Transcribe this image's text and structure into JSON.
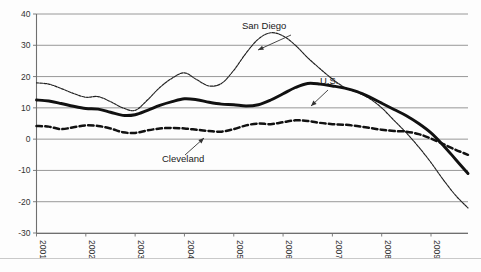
{
  "chart_data": {
    "type": "line",
    "title": "",
    "subtitle": "",
    "xlabel": "",
    "ylabel": "",
    "grid": true,
    "legend_position": "inline-annotations",
    "xlim": [
      2001,
      2009.75
    ],
    "ylim": [
      -30,
      40
    ],
    "yticks": [
      40,
      30,
      20,
      10,
      0,
      -10,
      -20,
      -30
    ],
    "ytick_labels": [
      "40",
      "30",
      "20",
      "10",
      "0",
      "-10",
      "-20",
      "-30"
    ],
    "xticks": [
      2001,
      2002,
      2003,
      2004,
      2005,
      2006,
      2007,
      2008,
      2009
    ],
    "xtick_labels": [
      "2001",
      "2002",
      "2003",
      "2004",
      "2005",
      "2006",
      "2007",
      "2008",
      "2009"
    ],
    "xtick_rotation": 90,
    "x": [
      2001.0,
      2001.25,
      2001.5,
      2001.75,
      2002.0,
      2002.25,
      2002.5,
      2002.75,
      2003.0,
      2003.25,
      2003.5,
      2003.75,
      2004.0,
      2004.25,
      2004.5,
      2004.75,
      2005.0,
      2005.25,
      2005.5,
      2005.75,
      2006.0,
      2006.25,
      2006.5,
      2006.75,
      2007.0,
      2007.25,
      2007.5,
      2007.75,
      2008.0,
      2008.25,
      2008.5,
      2008.75,
      2009.0,
      2009.25,
      2009.5,
      2009.75
    ],
    "series": [
      {
        "name": "San Diego",
        "style": "thin-dotted",
        "values": [
          18.0,
          17.6,
          16.2,
          14.6,
          13.4,
          13.6,
          12.0,
          10.0,
          9.2,
          12.5,
          16.5,
          19.5,
          21.2,
          19.0,
          17.0,
          17.8,
          22.0,
          27.5,
          32.0,
          34.0,
          33.0,
          30.0,
          26.0,
          22.5,
          19.2,
          16.5,
          15.0,
          13.0,
          10.0,
          6.0,
          2.0,
          -2.5,
          -7.5,
          -13.0,
          -18.0,
          -22.0
        ]
      },
      {
        "name": "U.S.",
        "style": "thick-solid",
        "values": [
          12.5,
          12.2,
          11.4,
          10.5,
          9.8,
          9.6,
          8.6,
          7.6,
          7.8,
          9.2,
          10.8,
          12.0,
          12.9,
          12.6,
          11.8,
          11.2,
          11.0,
          10.6,
          11.0,
          12.5,
          14.5,
          16.5,
          17.8,
          17.6,
          17.0,
          16.3,
          15.2,
          13.5,
          11.5,
          9.5,
          7.5,
          5.0,
          2.0,
          -2.0,
          -6.5,
          -11.0
        ]
      },
      {
        "name": "Cleveland",
        "style": "bold-dashed",
        "values": [
          4.2,
          4.0,
          3.2,
          3.8,
          4.4,
          4.2,
          3.4,
          2.2,
          2.0,
          2.8,
          3.4,
          3.6,
          3.4,
          3.0,
          2.6,
          2.4,
          3.2,
          4.4,
          5.0,
          4.8,
          5.4,
          6.0,
          5.8,
          5.2,
          4.8,
          4.6,
          4.2,
          3.6,
          3.0,
          2.6,
          2.4,
          1.6,
          0.2,
          -1.6,
          -3.4,
          -5.0
        ]
      }
    ],
    "annotations": [
      {
        "id": "annotation-san-diego",
        "label": "San Diego",
        "series": "San Diego",
        "label_x_px": 242,
        "label_y_px": 29,
        "arrow_from_px": [
          291,
          35
        ],
        "arrow_to_px": [
          258,
          50
        ]
      },
      {
        "id": "annotation-us",
        "label": "U.S.",
        "series": "U.S.",
        "label_x_px": 320,
        "label_y_px": 84,
        "arrow_from_px": [
          328,
          90
        ],
        "arrow_to_px": [
          311,
          106
        ]
      },
      {
        "id": "annotation-cleveland",
        "label": "Cleveland",
        "series": "Cleveland",
        "label_x_px": 162,
        "label_y_px": 162,
        "arrow_from_px": [
          185,
          155
        ],
        "arrow_to_px": [
          204,
          138
        ]
      }
    ],
    "colors": {
      "background": "#fdfdfd",
      "gridline": "#8c8c8c",
      "axis": "#6f6f6f",
      "series_san_diego": "#222222",
      "series_us": "#111111",
      "series_cleveland": "#111111",
      "text": "#1a1a1a"
    }
  }
}
